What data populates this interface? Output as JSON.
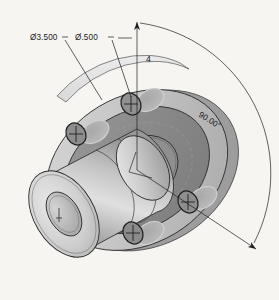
{
  "drawing": {
    "type": "isometric-cad-view",
    "subject": "flanged-hub-coupling",
    "background_color": "#f7f5f2",
    "line_color": "#2b2b2b"
  },
  "annotations": {
    "bolt_circle_diameter": "Ø3.500",
    "hole_diameter": "Ø.500",
    "hole_quantity": "4",
    "angular_spacing": "90.00°"
  },
  "shading": {
    "flange_front_face": "#8c8c8c",
    "flange_outer_rim": "#c9c9c9",
    "flange_rim_edge": "#ededed",
    "hub_face_light": "#e3e3e3",
    "hub_body_mid": "#b5b5b5",
    "hub_body_dark": "#909090",
    "bore_recess": "#bdbdbd",
    "counterbore_ring": "#b9b9b9"
  },
  "features": {
    "bolt_holes": [
      {
        "id": "hole-top",
        "cx": 131,
        "cy": 104
      },
      {
        "id": "hole-left",
        "cx": 76,
        "cy": 134
      },
      {
        "id": "hole-bottom",
        "cx": 133,
        "cy": 233
      },
      {
        "id": "hole-right",
        "cx": 188,
        "cy": 202
      }
    ],
    "hub_bore": {
      "cx": 55,
      "cy": 215
    },
    "center_axis": {
      "cx": 137,
      "cy": 170
    }
  }
}
